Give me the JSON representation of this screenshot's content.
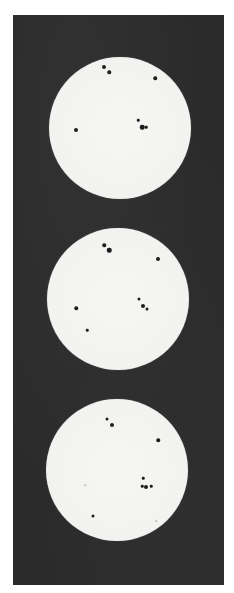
{
  "image": {
    "description": "Three photographs of the solar disk showing sunspots, stacked vertically on a dark background",
    "colors": {
      "page_background": "#ffffff",
      "plate_background": "#2b2b2b",
      "disk": "#f2f2f0",
      "sunspot": "#1e1e1e"
    },
    "disks": [
      {
        "label": "disk-top",
        "cx": 120,
        "cy": 128,
        "r": 71,
        "spots": [
          {
            "x": 104,
            "y": 67,
            "size": 4
          },
          {
            "x": 109,
            "y": 72,
            "size": 3.5
          },
          {
            "x": 155,
            "y": 78,
            "size": 3.5
          },
          {
            "x": 138,
            "y": 120,
            "size": 2.5
          },
          {
            "x": 142,
            "y": 127,
            "size": 4.5
          },
          {
            "x": 146,
            "y": 127,
            "size": 2.5
          },
          {
            "x": 76,
            "y": 130,
            "size": 4
          }
        ]
      },
      {
        "label": "disk-middle",
        "cx": 118,
        "cy": 299,
        "r": 71,
        "spots": [
          {
            "x": 104,
            "y": 245,
            "size": 3.5
          },
          {
            "x": 109,
            "y": 250,
            "size": 4.5
          },
          {
            "x": 158,
            "y": 259,
            "size": 4
          },
          {
            "x": 139,
            "y": 299,
            "size": 3
          },
          {
            "x": 143,
            "y": 306,
            "size": 4
          },
          {
            "x": 147,
            "y": 309,
            "size": 3
          },
          {
            "x": 76,
            "y": 308,
            "size": 3.5
          },
          {
            "x": 87,
            "y": 330,
            "size": 2.5
          }
        ]
      },
      {
        "label": "disk-bottom",
        "cx": 117,
        "cy": 470,
        "r": 71,
        "spots": [
          {
            "x": 107,
            "y": 419,
            "size": 3
          },
          {
            "x": 112,
            "y": 425,
            "size": 4
          },
          {
            "x": 158,
            "y": 440,
            "size": 3.5
          },
          {
            "x": 143,
            "y": 478,
            "size": 2.5
          },
          {
            "x": 142,
            "y": 486,
            "size": 2.5
          },
          {
            "x": 146,
            "y": 487,
            "size": 4
          },
          {
            "x": 151,
            "y": 486,
            "size": 2.5
          },
          {
            "x": 93,
            "y": 516,
            "size": 3
          },
          {
            "x": 156,
            "y": 521,
            "size": 1.5,
            "faint": true
          },
          {
            "x": 85,
            "y": 485,
            "size": 1.5,
            "faint": true
          }
        ]
      }
    ]
  }
}
